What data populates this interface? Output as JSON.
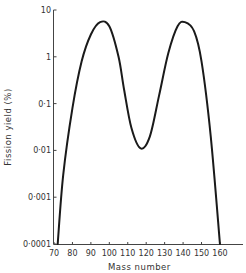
{
  "chart_data": {
    "type": "line",
    "title": "",
    "xlabel": "Mass number",
    "ylabel": "Fission yield (%)",
    "xlim": [
      70,
      170
    ],
    "ylim": [
      0.0001,
      10
    ],
    "yscale": "log",
    "grid": false,
    "legend": null,
    "x_ticks": [
      70,
      80,
      90,
      100,
      110,
      120,
      130,
      140,
      150,
      160
    ],
    "x_tick_labels": [
      "70",
      "80",
      "90",
      "100",
      "110",
      "120",
      "130",
      "140",
      "150",
      "160"
    ],
    "y_ticks": [
      10,
      1,
      0.1,
      0.01,
      0.001,
      0.0001
    ],
    "y_tick_labels": [
      "10",
      "1",
      "0·1",
      "0·01",
      "0·001",
      "0·0001"
    ],
    "series": [
      {
        "name": "Fission yield",
        "x": [
          72,
          75,
          80,
          85,
          90,
          95,
          100,
          105,
          108,
          112,
          117,
          122,
          127,
          132,
          137,
          141,
          146,
          150,
          155,
          160
        ],
        "values": [
          0.0001,
          0.003,
          0.08,
          0.8,
          3,
          5.5,
          4.5,
          1,
          0.2,
          0.03,
          0.011,
          0.02,
          0.15,
          1.2,
          4.5,
          5.5,
          3.5,
          0.8,
          0.02,
          0.0001
        ]
      }
    ],
    "annotations": []
  },
  "colors": {
    "curve": "#1a1a1a",
    "axis": "#444444",
    "text": "#333333",
    "background": "#ffffff"
  }
}
